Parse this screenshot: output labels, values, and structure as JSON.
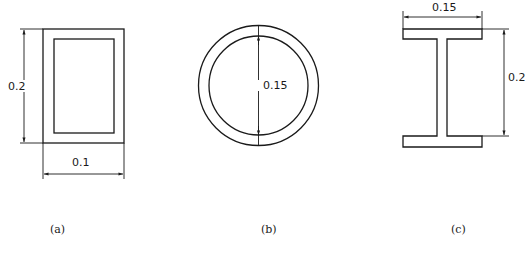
{
  "figure": {
    "panels": [
      {
        "id": "a",
        "shape": "hollow-rectangle",
        "caption": "(a)",
        "dimensions": {
          "height_label": "0.2",
          "width_label": "0.1"
        }
      },
      {
        "id": "b",
        "shape": "hollow-circle",
        "caption": "(b)",
        "dimensions": {
          "diameter_label": "0.15"
        }
      },
      {
        "id": "c",
        "shape": "i-beam",
        "caption": "(c)",
        "dimensions": {
          "width_label": "0.15",
          "height_label": "0.2"
        }
      }
    ],
    "colors": {
      "line": "#1a1a1a",
      "background": "#ffffff"
    }
  }
}
